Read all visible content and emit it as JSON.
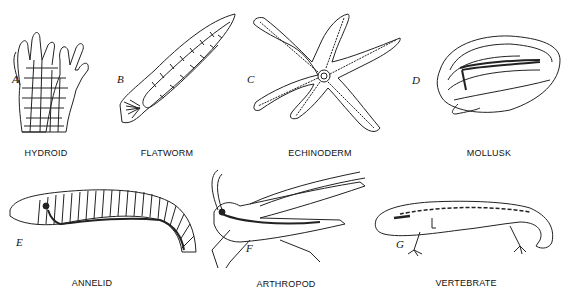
{
  "figure": {
    "panels": [
      {
        "letter": "A",
        "label": "HYDROID"
      },
      {
        "letter": "B",
        "label": "FLATWORM"
      },
      {
        "letter": "C",
        "label": "ECHINODERM"
      },
      {
        "letter": "D",
        "label": "MOLLUSK"
      },
      {
        "letter": "E",
        "label": "ANNELID"
      },
      {
        "letter": "F",
        "label": "ARTHROPOD"
      },
      {
        "letter": "G",
        "label": "VERTEBRATE"
      }
    ]
  }
}
